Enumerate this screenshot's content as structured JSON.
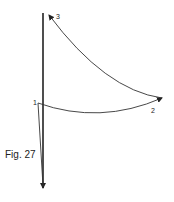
{
  "figure": {
    "caption": "Fig. 27",
    "points": [
      {
        "label": "1",
        "x": 38,
        "y": 103
      },
      {
        "label": "2",
        "x": 162,
        "y": 98
      },
      {
        "label": "3",
        "x": 49,
        "y": 15
      }
    ],
    "stroke_color": "#222222"
  }
}
